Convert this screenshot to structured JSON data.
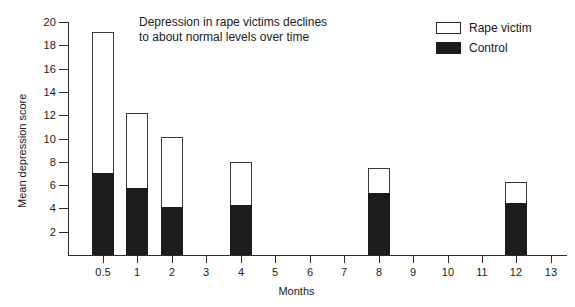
{
  "chart_data": {
    "type": "bar",
    "title": "Depression in rape victims declines to about normal levels over time",
    "title_lines": [
      "Depression in rape victims declines",
      "to about normal levels over time"
    ],
    "xlabel": "Months",
    "ylabel": "Mean depression score",
    "ylim": [
      0,
      20
    ],
    "y_ticks": [
      2,
      4,
      6,
      8,
      10,
      12,
      14,
      16,
      18,
      20
    ],
    "x_ticks": [
      "0.5",
      "1",
      "2",
      "3",
      "4",
      "5",
      "6",
      "7",
      "8",
      "9",
      "10",
      "11",
      "12",
      "13"
    ],
    "grid": false,
    "legend_position": "top-right",
    "stacked": false,
    "note": "Each bar drawn as an outlined (Rape victim) column with a filled (Control) sub-column from the baseline.",
    "categories": [
      "0.5",
      "1",
      "2",
      "4",
      "8",
      "12"
    ],
    "series": [
      {
        "name": "Rape victim",
        "color": "#ffffff",
        "values": [
          19.1,
          12.2,
          10.1,
          8.0,
          7.5,
          6.3
        ]
      },
      {
        "name": "Control",
        "color": "#1c1c1c",
        "values": [
          7.0,
          5.75,
          4.1,
          4.25,
          5.3,
          4.5
        ]
      }
    ]
  },
  "legend": {
    "items": [
      {
        "label": "Rape victim",
        "swatch": "hollow"
      },
      {
        "label": "Control",
        "swatch": "filled"
      }
    ]
  },
  "axes": {
    "y_title": "Mean depression score",
    "x_title": "Months"
  }
}
